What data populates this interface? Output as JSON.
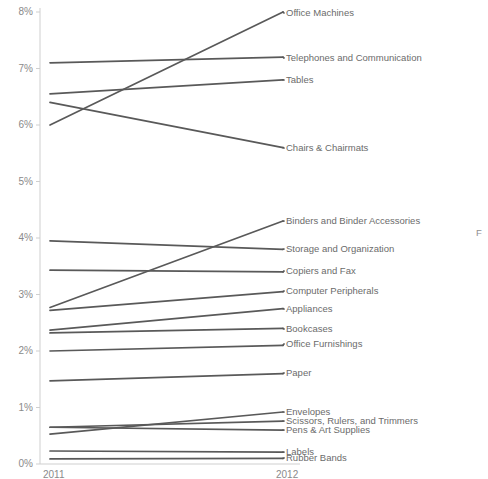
{
  "chart_data": {
    "type": "line",
    "subtype": "slope-chart",
    "title": "",
    "xlabel": "",
    "ylabel": "",
    "categories": [
      "2011",
      "2012"
    ],
    "x_tick_labels": [
      "2011",
      "2012"
    ],
    "y_tick_labels": [
      "0%",
      "1%",
      "2%",
      "3%",
      "4%",
      "5%",
      "6%",
      "7%",
      "8%"
    ],
    "y_tick_values": [
      0,
      1,
      2,
      3,
      4,
      5,
      6,
      7,
      8
    ],
    "ylim": [
      0,
      8
    ],
    "y_unit": "%",
    "grid": false,
    "legend_position": "right-inline-labels",
    "line_color": "#595959",
    "axis_color": "#cfcfcf",
    "tick_label_color": "#8a8a8a",
    "series": [
      {
        "name": "Office Machines",
        "values": [
          6.0,
          8.0
        ]
      },
      {
        "name": "Telephones and Communication",
        "values": [
          7.1,
          7.2
        ]
      },
      {
        "name": "Tables",
        "values": [
          6.55,
          6.8
        ]
      },
      {
        "name": "Chairs & Chairmats",
        "values": [
          6.4,
          5.6
        ]
      },
      {
        "name": "Binders and Binder Accessories",
        "values": [
          2.77,
          4.3
        ]
      },
      {
        "name": "Storage and Organization",
        "values": [
          3.95,
          3.8
        ]
      },
      {
        "name": "Copiers and Fax",
        "values": [
          3.43,
          3.4
        ]
      },
      {
        "name": "Computer Peripherals",
        "values": [
          2.72,
          3.05
        ]
      },
      {
        "name": "Appliances",
        "values": [
          2.37,
          2.75
        ]
      },
      {
        "name": "Bookcases",
        "values": [
          2.32,
          2.4
        ]
      },
      {
        "name": "Office Furnishings",
        "values": [
          2.0,
          2.1
        ]
      },
      {
        "name": "Paper",
        "values": [
          1.47,
          1.6
        ]
      },
      {
        "name": "Envelopes",
        "values": [
          0.53,
          0.92
        ]
      },
      {
        "name": "Scissors, Rulers, and Trimmers",
        "values": [
          0.65,
          0.76
        ]
      },
      {
        "name": "Pens & Art Supplies",
        "values": [
          0.65,
          0.6
        ]
      },
      {
        "name": "Labels",
        "values": [
          0.23,
          0.21
        ]
      },
      {
        "name": "Rubber Bands",
        "values": [
          0.09,
          0.1
        ]
      }
    ],
    "label_y_positions_px": [
      13,
      58,
      80,
      148,
      221,
      249,
      271,
      291,
      309,
      329,
      344,
      373,
      412,
      421,
      430,
      452,
      458
    ],
    "clipped_right_text": "F"
  }
}
